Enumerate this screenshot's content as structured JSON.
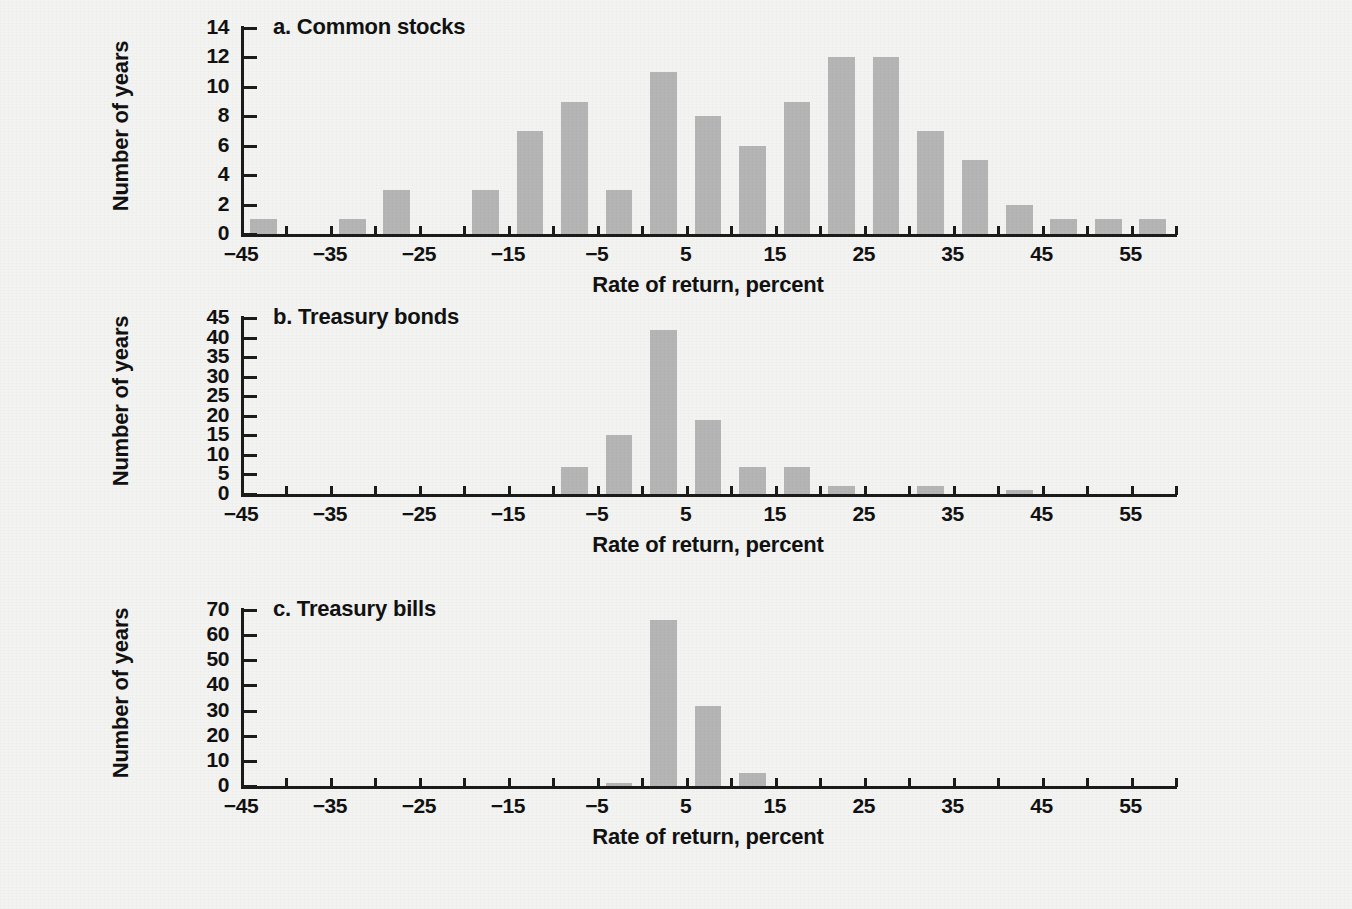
{
  "figure": {
    "background_color": "#f3f3f1",
    "bar_color": "#b5b5b5",
    "axis_color": "#1b1b1b"
  },
  "chart_data": [
    {
      "type": "bar",
      "title": "a. Common stocks",
      "xlabel": "Rate of return, percent",
      "ylabel": "Number of years",
      "xlim": [
        -45,
        60
      ],
      "ylim": [
        0,
        14
      ],
      "ytick_step": 2,
      "yticks": [
        "0",
        "2",
        "4",
        "6",
        "8",
        "10",
        "12",
        "14"
      ],
      "xticks": [
        "-45",
        "-35",
        "-25",
        "-15",
        "-5",
        "5",
        "15",
        "25",
        "35",
        "45",
        "55"
      ],
      "xtick_labels_display": [
        "−45",
        "−35",
        "−25",
        "−15",
        "−5",
        "5",
        "15",
        "25",
        "35",
        "45",
        "55"
      ],
      "minor_tick_step": 5,
      "grid": false,
      "legend": "none",
      "bin_width": 5,
      "bins": [
        {
          "x0": -45,
          "x1": -40,
          "value": 1
        },
        {
          "x0": -40,
          "x1": -35,
          "value": 0
        },
        {
          "x0": -35,
          "x1": -30,
          "value": 1
        },
        {
          "x0": -30,
          "x1": -25,
          "value": 3
        },
        {
          "x0": -25,
          "x1": -20,
          "value": 0
        },
        {
          "x0": -20,
          "x1": -15,
          "value": 3
        },
        {
          "x0": -15,
          "x1": -10,
          "value": 7
        },
        {
          "x0": -10,
          "x1": -5,
          "value": 9
        },
        {
          "x0": -5,
          "x1": 0,
          "value": 3
        },
        {
          "x0": 0,
          "x1": 5,
          "value": 11
        },
        {
          "x0": 5,
          "x1": 10,
          "value": 8
        },
        {
          "x0": 10,
          "x1": 15,
          "value": 6
        },
        {
          "x0": 15,
          "x1": 20,
          "value": 9
        },
        {
          "x0": 20,
          "x1": 25,
          "value": 12
        },
        {
          "x0": 25,
          "x1": 30,
          "value": 12
        },
        {
          "x0": 30,
          "x1": 35,
          "value": 7
        },
        {
          "x0": 35,
          "x1": 40,
          "value": 5
        },
        {
          "x0": 40,
          "x1": 45,
          "value": 2
        },
        {
          "x0": 45,
          "x1": 50,
          "value": 1
        },
        {
          "x0": 50,
          "x1": 55,
          "value": 1
        },
        {
          "x0": 55,
          "x1": 60,
          "value": 1
        }
      ]
    },
    {
      "type": "bar",
      "title": "b. Treasury bonds",
      "xlabel": "Rate of return, percent",
      "ylabel": "Number of years",
      "xlim": [
        -45,
        60
      ],
      "ylim": [
        0,
        45
      ],
      "ytick_step": 5,
      "yticks": [
        "0",
        "5",
        "10",
        "15",
        "20",
        "25",
        "30",
        "35",
        "40",
        "45"
      ],
      "xticks": [
        "-45",
        "-35",
        "-25",
        "-15",
        "-5",
        "5",
        "15",
        "25",
        "35",
        "45",
        "55"
      ],
      "xtick_labels_display": [
        "−45",
        "−35",
        "−25",
        "−15",
        "−5",
        "5",
        "15",
        "25",
        "35",
        "45",
        "55"
      ],
      "minor_tick_step": 5,
      "grid": false,
      "legend": "none",
      "bin_width": 5,
      "bins": [
        {
          "x0": -45,
          "x1": -40,
          "value": 0
        },
        {
          "x0": -40,
          "x1": -35,
          "value": 0
        },
        {
          "x0": -35,
          "x1": -30,
          "value": 0
        },
        {
          "x0": -30,
          "x1": -25,
          "value": 0
        },
        {
          "x0": -25,
          "x1": -20,
          "value": 0
        },
        {
          "x0": -20,
          "x1": -15,
          "value": 0
        },
        {
          "x0": -15,
          "x1": -10,
          "value": 0
        },
        {
          "x0": -10,
          "x1": -5,
          "value": 7
        },
        {
          "x0": -5,
          "x1": 0,
          "value": 15
        },
        {
          "x0": 0,
          "x1": 5,
          "value": 42
        },
        {
          "x0": 5,
          "x1": 10,
          "value": 19
        },
        {
          "x0": 10,
          "x1": 15,
          "value": 7
        },
        {
          "x0": 15,
          "x1": 20,
          "value": 7
        },
        {
          "x0": 20,
          "x1": 25,
          "value": 2
        },
        {
          "x0": 25,
          "x1": 30,
          "value": 0
        },
        {
          "x0": 30,
          "x1": 35,
          "value": 2
        },
        {
          "x0": 35,
          "x1": 40,
          "value": 0
        },
        {
          "x0": 40,
          "x1": 45,
          "value": 1
        },
        {
          "x0": 45,
          "x1": 50,
          "value": 0
        },
        {
          "x0": 50,
          "x1": 55,
          "value": 0
        },
        {
          "x0": 55,
          "x1": 60,
          "value": 0
        }
      ]
    },
    {
      "type": "bar",
      "title": "c. Treasury bills",
      "xlabel": "Rate of return, percent",
      "ylabel": "Number of years",
      "xlim": [
        -45,
        60
      ],
      "ylim": [
        0,
        70
      ],
      "ytick_step": 10,
      "yticks": [
        "0",
        "10",
        "20",
        "30",
        "40",
        "50",
        "60",
        "70"
      ],
      "xticks": [
        "-45",
        "-35",
        "-25",
        "-15",
        "-5",
        "5",
        "15",
        "25",
        "35",
        "45",
        "55"
      ],
      "xtick_labels_display": [
        "−45",
        "−35",
        "−25",
        "−15",
        "−5",
        "5",
        "15",
        "25",
        "35",
        "45",
        "55"
      ],
      "minor_tick_step": 5,
      "grid": false,
      "legend": "none",
      "bin_width": 5,
      "bins": [
        {
          "x0": -45,
          "x1": -40,
          "value": 0
        },
        {
          "x0": -40,
          "x1": -35,
          "value": 0
        },
        {
          "x0": -35,
          "x1": -30,
          "value": 0
        },
        {
          "x0": -30,
          "x1": -25,
          "value": 0
        },
        {
          "x0": -25,
          "x1": -20,
          "value": 0
        },
        {
          "x0": -20,
          "x1": -15,
          "value": 0
        },
        {
          "x0": -15,
          "x1": -10,
          "value": 0
        },
        {
          "x0": -10,
          "x1": -5,
          "value": 0
        },
        {
          "x0": -5,
          "x1": 0,
          "value": 1
        },
        {
          "x0": 0,
          "x1": 5,
          "value": 66
        },
        {
          "x0": 5,
          "x1": 10,
          "value": 32
        },
        {
          "x0": 10,
          "x1": 15,
          "value": 5
        },
        {
          "x0": 15,
          "x1": 20,
          "value": 0
        },
        {
          "x0": 20,
          "x1": 25,
          "value": 0
        },
        {
          "x0": 25,
          "x1": 30,
          "value": 0
        },
        {
          "x0": 30,
          "x1": 35,
          "value": 0
        },
        {
          "x0": 35,
          "x1": 40,
          "value": 0
        },
        {
          "x0": 40,
          "x1": 45,
          "value": 0
        },
        {
          "x0": 45,
          "x1": 50,
          "value": 0
        },
        {
          "x0": 50,
          "x1": 55,
          "value": 0
        },
        {
          "x0": 55,
          "x1": 60,
          "value": 0
        }
      ]
    }
  ]
}
